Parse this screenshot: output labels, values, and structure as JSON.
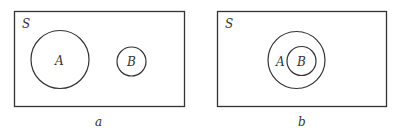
{
  "figure": {
    "panels": [
      {
        "caption": "a",
        "universe_label": "S",
        "sets": [
          {
            "label": "A",
            "cx": 60,
            "cy": 59.5,
            "r": 29
          },
          {
            "label": "B",
            "cx": 131.5,
            "cy": 61.5,
            "r": 14.5
          }
        ],
        "relation": "disjoint"
      },
      {
        "caption": "b",
        "universe_label": "S",
        "sets": [
          {
            "label": "A",
            "cx": 296.5,
            "cy": 60,
            "r": 28.5
          },
          {
            "label": "B",
            "cx": 301.5,
            "cy": 61,
            "r": 14.5
          }
        ],
        "relation": "B subset of A"
      }
    ],
    "stroke_color": "#333333",
    "background": "#ffffff"
  }
}
